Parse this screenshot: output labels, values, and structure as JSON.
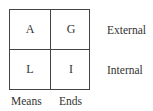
{
  "cells": {
    "top_left": "A",
    "top_right": "G",
    "bottom_left": "L",
    "bottom_right": "I"
  },
  "row_labels": [
    "External",
    "Internal"
  ],
  "column_labels": [
    "Means",
    "Ends"
  ]
}
